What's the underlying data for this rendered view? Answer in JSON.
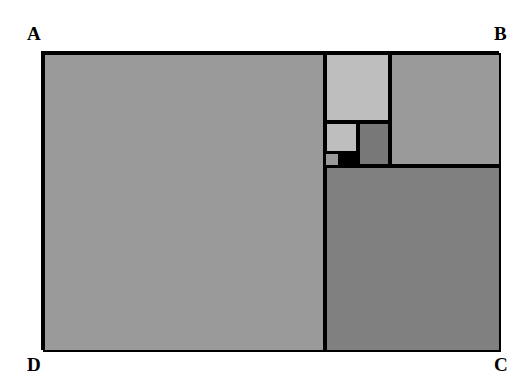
{
  "figure": {
    "type": "geometric-diagram",
    "canvas": {
      "width": 529,
      "height": 392,
      "background": "#ffffff"
    },
    "outer_rectangle": {
      "name": "ABCD",
      "x": 41,
      "y": 51,
      "width": 458,
      "height": 299,
      "stroke": "#000000",
      "stroke_width": 2
    },
    "corner_labels": [
      {
        "id": "A",
        "text": "A",
        "position": "top-left",
        "x": 27,
        "y": 24
      },
      {
        "id": "B",
        "text": "B",
        "position": "top-right",
        "x": 494,
        "y": 24
      },
      {
        "id": "C",
        "text": "C",
        "position": "bottom-right",
        "x": 494,
        "y": 355
      },
      {
        "id": "D",
        "text": "D",
        "position": "bottom-left",
        "x": 27,
        "y": 355
      }
    ],
    "palette": {
      "lightest_gray": "#bebebe",
      "light_gray": "#b4b4b4",
      "medium_gray": "#9a9a9a",
      "dark_gray": "#808080",
      "darker_gray": "#787878",
      "black": "#000000",
      "white": "#ffffff"
    },
    "squares": [
      {
        "id": "square-1",
        "order": 1,
        "label": "largest square",
        "x": 0,
        "y": 0,
        "width": 282,
        "height": 299,
        "fill": "#9a9a9a",
        "stroke": "#000000"
      },
      {
        "id": "square-2",
        "order": 2,
        "label": "bottom-right square",
        "x": 282,
        "y": 113,
        "width": 176,
        "height": 186,
        "fill": "#808080",
        "stroke": "#000000"
      },
      {
        "id": "square-3",
        "order": 3,
        "label": "top-right square",
        "x": 347,
        "y": 0,
        "width": 111,
        "height": 113,
        "fill": "#9a9a9a",
        "stroke": "#000000"
      },
      {
        "id": "square-4",
        "order": 4,
        "label": "upper small square",
        "x": 282,
        "y": 0,
        "width": 65,
        "height": 69,
        "fill": "#bebebe",
        "stroke": "#000000"
      },
      {
        "id": "square-5",
        "order": 5,
        "label": "mid small square",
        "x": 315,
        "y": 69,
        "width": 32,
        "height": 44,
        "fill": "#787878",
        "stroke": "#000000"
      },
      {
        "id": "square-6",
        "order": 6,
        "label": "tiny light square",
        "x": 282,
        "y": 69,
        "width": 33,
        "height": 31,
        "fill": "#bebebe",
        "stroke": "#000000"
      },
      {
        "id": "square-7",
        "order": 7,
        "label": "smallest gray square",
        "x": 282,
        "y": 100,
        "width": 14,
        "height": 13,
        "fill": "#9a9a9a",
        "stroke": "#000000"
      },
      {
        "id": "square-8",
        "order": 8,
        "label": "spiral centre black square",
        "x": 296,
        "y": 98,
        "width": 19,
        "height": 15,
        "fill": "#000000",
        "stroke": "#000000"
      }
    ]
  }
}
